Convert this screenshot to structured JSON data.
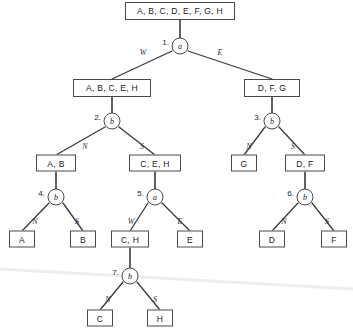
{
  "diagram": {
    "colors": {
      "stroke": "#4a4a4a",
      "edge": "#3a3a3a",
      "text": "#1a1a1a",
      "watermark": "#ededed",
      "background": "#ffffff"
    },
    "boxes": [
      {
        "id": "root-set",
        "label": "A, B, C, D, E, F, G, H",
        "x": 180,
        "y": 11,
        "w": 110,
        "h": 18
      },
      {
        "id": "set-west",
        "label": "A, B, C, E, H",
        "x": 112,
        "y": 88,
        "w": 78,
        "h": 18
      },
      {
        "id": "set-east",
        "label": "D, F, G",
        "x": 272,
        "y": 88,
        "w": 56,
        "h": 18
      },
      {
        "id": "set-ab",
        "label": "A, B",
        "x": 56,
        "y": 163,
        "w": 40,
        "h": 17
      },
      {
        "id": "set-ceh",
        "label": "C, E, H",
        "x": 155,
        "y": 163,
        "w": 52,
        "h": 17
      },
      {
        "id": "leaf-g",
        "label": "G",
        "x": 244,
        "y": 163,
        "w": 26,
        "h": 17
      },
      {
        "id": "set-df",
        "label": "D, F",
        "x": 305,
        "y": 163,
        "w": 40,
        "h": 17
      },
      {
        "id": "leaf-a",
        "label": "A",
        "x": 22,
        "y": 239,
        "w": 26,
        "h": 17
      },
      {
        "id": "leaf-b",
        "label": "B",
        "x": 83,
        "y": 239,
        "w": 26,
        "h": 17
      },
      {
        "id": "set-ch",
        "label": "C, H",
        "x": 130,
        "y": 239,
        "w": 38,
        "h": 17
      },
      {
        "id": "leaf-e",
        "label": "E",
        "x": 190,
        "y": 239,
        "w": 26,
        "h": 17
      },
      {
        "id": "leaf-d",
        "label": "D",
        "x": 272,
        "y": 239,
        "w": 26,
        "h": 17
      },
      {
        "id": "leaf-f",
        "label": "F",
        "x": 334,
        "y": 239,
        "w": 26,
        "h": 17
      },
      {
        "id": "leaf-c",
        "label": "C",
        "x": 100,
        "y": 318,
        "w": 26,
        "h": 17
      },
      {
        "id": "leaf-h",
        "label": "H",
        "x": 160,
        "y": 318,
        "w": 26,
        "h": 17
      }
    ],
    "nodes": [
      {
        "id": "n1",
        "index": "1.",
        "symbol": "a",
        "x": 180,
        "y": 46,
        "left_label": "W",
        "right_label": "E"
      },
      {
        "id": "n2",
        "index": "2.",
        "symbol": "b",
        "x": 112,
        "y": 121,
        "left_label": "N",
        "right_label": "S"
      },
      {
        "id": "n3",
        "index": "3.",
        "symbol": "b",
        "x": 272,
        "y": 121,
        "left_label": "N",
        "right_label": "S"
      },
      {
        "id": "n4",
        "index": "4.",
        "symbol": "b",
        "x": 56,
        "y": 197,
        "left_label": "N",
        "right_label": "S"
      },
      {
        "id": "n5",
        "index": "5.",
        "symbol": "a",
        "x": 155,
        "y": 197,
        "left_label": "W",
        "right_label": "E"
      },
      {
        "id": "n6",
        "index": "6.",
        "symbol": "b",
        "x": 305,
        "y": 197,
        "left_label": "N",
        "right_label": "S"
      },
      {
        "id": "n7",
        "index": "7.",
        "symbol": "b",
        "x": 130,
        "y": 276,
        "left_label": "N",
        "right_label": "S"
      }
    ],
    "edge_labels": [
      {
        "id": "e1-w",
        "text": "W",
        "x": 143,
        "y": 52
      },
      {
        "id": "e1-e",
        "text": "E",
        "x": 220,
        "y": 52
      },
      {
        "id": "e2-n",
        "text": "N",
        "x": 85,
        "y": 146
      },
      {
        "id": "e2-s",
        "text": "S",
        "x": 142,
        "y": 146
      },
      {
        "id": "e3-n",
        "text": "N",
        "x": 249,
        "y": 146
      },
      {
        "id": "e3-s",
        "text": "S",
        "x": 293,
        "y": 146
      },
      {
        "id": "e4-n",
        "text": "N",
        "x": 35,
        "y": 221
      },
      {
        "id": "e4-s",
        "text": "S",
        "x": 77,
        "y": 221
      },
      {
        "id": "e5-w",
        "text": "W",
        "x": 131,
        "y": 221
      },
      {
        "id": "e5-e",
        "text": "E",
        "x": 180,
        "y": 221
      },
      {
        "id": "e6-n",
        "text": "N",
        "x": 284,
        "y": 221
      },
      {
        "id": "e6-s",
        "text": "S",
        "x": 327,
        "y": 221
      },
      {
        "id": "e7-n",
        "text": "N",
        "x": 108,
        "y": 299
      },
      {
        "id": "e7-s",
        "text": "S",
        "x": 155,
        "y": 299
      }
    ],
    "edges": [
      {
        "id": "root-to-n1",
        "x1": 180,
        "y1": 20,
        "x2": 180,
        "y2": 38,
        "kind": "stem"
      },
      {
        "id": "n1-to-west",
        "x1": 172,
        "y1": 51,
        "x2": 112,
        "y2": 79,
        "kind": "branch"
      },
      {
        "id": "n1-to-east",
        "x1": 188,
        "y1": 51,
        "x2": 272,
        "y2": 79,
        "kind": "branch"
      },
      {
        "id": "west-to-n2",
        "x1": 112,
        "y1": 97,
        "x2": 112,
        "y2": 113,
        "kind": "stem"
      },
      {
        "id": "east-to-n3",
        "x1": 272,
        "y1": 97,
        "x2": 272,
        "y2": 113,
        "kind": "stem"
      },
      {
        "id": "n2-to-ab",
        "x1": 105,
        "y1": 127,
        "x2": 56,
        "y2": 155,
        "kind": "branch"
      },
      {
        "id": "n2-to-ceh",
        "x1": 119,
        "y1": 127,
        "x2": 155,
        "y2": 155,
        "kind": "branch"
      },
      {
        "id": "n3-to-g",
        "x1": 265,
        "y1": 127,
        "x2": 244,
        "y2": 155,
        "kind": "branch"
      },
      {
        "id": "n3-to-df",
        "x1": 279,
        "y1": 127,
        "x2": 305,
        "y2": 155,
        "kind": "branch"
      },
      {
        "id": "ab-to-n4",
        "x1": 56,
        "y1": 172,
        "x2": 56,
        "y2": 189,
        "kind": "stem"
      },
      {
        "id": "ceh-to-n5",
        "x1": 155,
        "y1": 172,
        "x2": 155,
        "y2": 189,
        "kind": "stem"
      },
      {
        "id": "df-to-n6",
        "x1": 305,
        "y1": 172,
        "x2": 305,
        "y2": 189,
        "kind": "stem"
      },
      {
        "id": "n4-to-a",
        "x1": 49,
        "y1": 203,
        "x2": 22,
        "y2": 231,
        "kind": "branch"
      },
      {
        "id": "n4-to-b",
        "x1": 63,
        "y1": 203,
        "x2": 83,
        "y2": 231,
        "kind": "branch"
      },
      {
        "id": "n5-to-ch",
        "x1": 148,
        "y1": 203,
        "x2": 130,
        "y2": 231,
        "kind": "branch"
      },
      {
        "id": "n5-to-e",
        "x1": 162,
        "y1": 203,
        "x2": 190,
        "y2": 231,
        "kind": "branch"
      },
      {
        "id": "n6-to-d",
        "x1": 298,
        "y1": 203,
        "x2": 272,
        "y2": 231,
        "kind": "branch"
      },
      {
        "id": "n6-to-f",
        "x1": 312,
        "y1": 203,
        "x2": 334,
        "y2": 231,
        "kind": "branch"
      },
      {
        "id": "ch-to-n7",
        "x1": 130,
        "y1": 248,
        "x2": 130,
        "y2": 268,
        "kind": "stem"
      },
      {
        "id": "n7-to-c",
        "x1": 123,
        "y1": 282,
        "x2": 100,
        "y2": 310,
        "kind": "branch"
      },
      {
        "id": "n7-to-h",
        "x1": 137,
        "y1": 282,
        "x2": 160,
        "y2": 310,
        "kind": "branch"
      }
    ],
    "watermark": {
      "x1": 0,
      "y1": 269,
      "x2": 353,
      "y2": 289
    }
  }
}
